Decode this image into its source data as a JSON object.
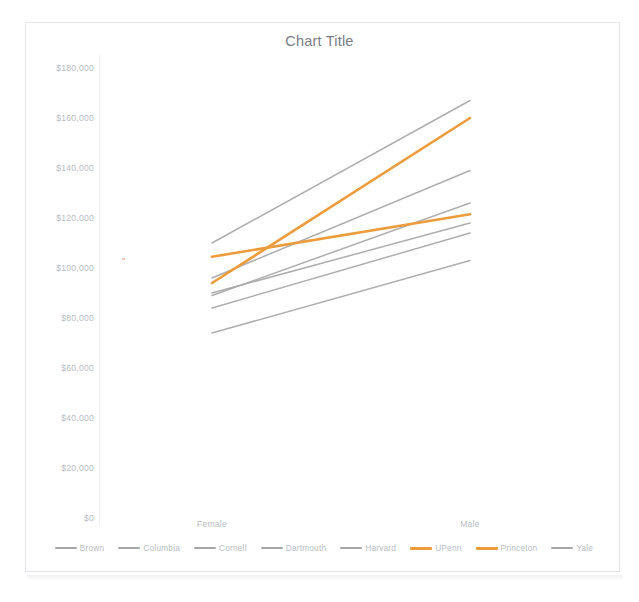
{
  "chart_data": {
    "type": "line",
    "title": "Chart Title",
    "xlabel": "",
    "ylabel": "",
    "categories": [
      "Female",
      "Male"
    ],
    "ylim": [
      0,
      180000
    ],
    "yticks": [
      0,
      20000,
      40000,
      60000,
      80000,
      100000,
      120000,
      140000,
      160000,
      180000
    ],
    "ytick_labels": [
      "$0",
      "$20,000",
      "$40,000",
      "$60,000",
      "$80,000",
      "$100,000",
      "$120,000",
      "$140,000",
      "$160,000",
      "$180,000"
    ],
    "grid": false,
    "legend_position": "bottom",
    "series": [
      {
        "name": "Brown",
        "values": [
          90000,
          118000
        ],
        "color": "#a6a6a6"
      },
      {
        "name": "Columbia",
        "values": [
          110000,
          167000
        ],
        "color": "#a6a6a6"
      },
      {
        "name": "Cornell",
        "values": [
          84000,
          114000
        ],
        "color": "#a6a6a6"
      },
      {
        "name": "Dartmouth",
        "values": [
          96000,
          139000
        ],
        "color": "#a6a6a6"
      },
      {
        "name": "Harvard",
        "values": [
          89000,
          126000
        ],
        "color": "#a6a6a6"
      },
      {
        "name": "UPenn",
        "values": [
          94000,
          160000
        ],
        "color": "#ed9c3d"
      },
      {
        "name": "Princeton",
        "values": [
          104500,
          121500
        ],
        "color": "#ed9c3d"
      },
      {
        "name": "Yale",
        "values": [
          74000,
          103000
        ],
        "color": "#a6a6a6"
      }
    ]
  },
  "axis": {
    "ytick_labels": [
      "$180,000",
      "$160,000",
      "$140,000",
      "$120,000",
      "$100,000",
      "$80,000",
      "$60,000",
      "$40,000",
      "$20,000",
      "$0"
    ],
    "categories": [
      "Female",
      "Male"
    ]
  },
  "legend": {
    "items": [
      {
        "label": "Brown"
      },
      {
        "label": "Columbia"
      },
      {
        "label": "Cornell"
      },
      {
        "label": "Dartmouth"
      },
      {
        "label": "Harvard"
      },
      {
        "label": "UPenn"
      },
      {
        "label": "Princeton"
      },
      {
        "label": "Yale"
      }
    ]
  },
  "colors": {
    "gray_series": "#a6a6a6",
    "orange_series": "#ed9c3d",
    "title_text": "#7b7d85",
    "tick_text": "#b9bcc4",
    "frame": "#e3e4e8"
  }
}
